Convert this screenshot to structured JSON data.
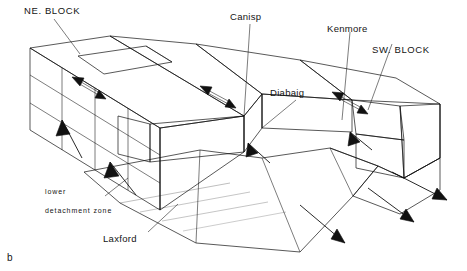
{
  "figure": {
    "id_label": "b",
    "type": "geological-block-diagram"
  },
  "labels": {
    "ne_block": "NE. BLOCK",
    "sw_block": "SW. BLOCK",
    "canisp": "Canisp",
    "kenmore": "Kenmore",
    "diabaig": "Diabaig",
    "laxford": "Laxford",
    "detachment_line1": "lower",
    "detachment_line2": "detachment zone"
  },
  "colors": {
    "line": "#111111",
    "background": "#ffffff",
    "stipple": "#555555",
    "hachure": "#777777",
    "arrow_fill": "#111111"
  },
  "annotations": {
    "strike_slip_arrow_pairs": 3,
    "extension_arrows": 3,
    "transport_arrows": 3
  }
}
